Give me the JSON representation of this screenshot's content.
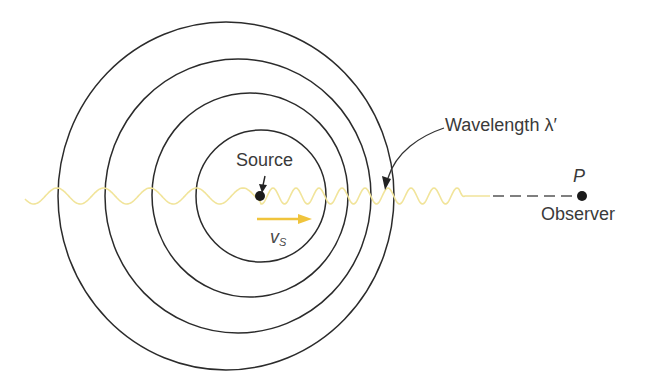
{
  "diagram": {
    "labels": {
      "source": "Source",
      "wavelength": "Wavelength λ′",
      "observer_point": "P",
      "observer": "Observer",
      "velocity_symbol": "v",
      "velocity_subscript": "S"
    },
    "wavefronts": [
      {
        "cx": 226,
        "cy": 196,
        "rx": 168,
        "ry": 174
      },
      {
        "cx": 238,
        "cy": 196,
        "rx": 133,
        "ry": 137
      },
      {
        "cx": 250,
        "cy": 195,
        "rx": 98,
        "ry": 102
      },
      {
        "cx": 261,
        "cy": 196,
        "rx": 65,
        "ry": 66
      }
    ],
    "source_position": {
      "x": 260,
      "y": 196
    },
    "observer_position": {
      "x": 582,
      "y": 196
    },
    "wave": {
      "left_wavelength_px": 46.5,
      "right_wavelength_px": 23,
      "amplitude_px": 8,
      "start_x": 25,
      "end_wave_x": 465,
      "tail_end_x": 490
    },
    "colors": {
      "wave": "#f1e49a",
      "velocity_arrow": "#f0c43c",
      "circles": "#2b2b2b",
      "text": "#3a3a3a",
      "dots": "#1a1a1a"
    }
  }
}
